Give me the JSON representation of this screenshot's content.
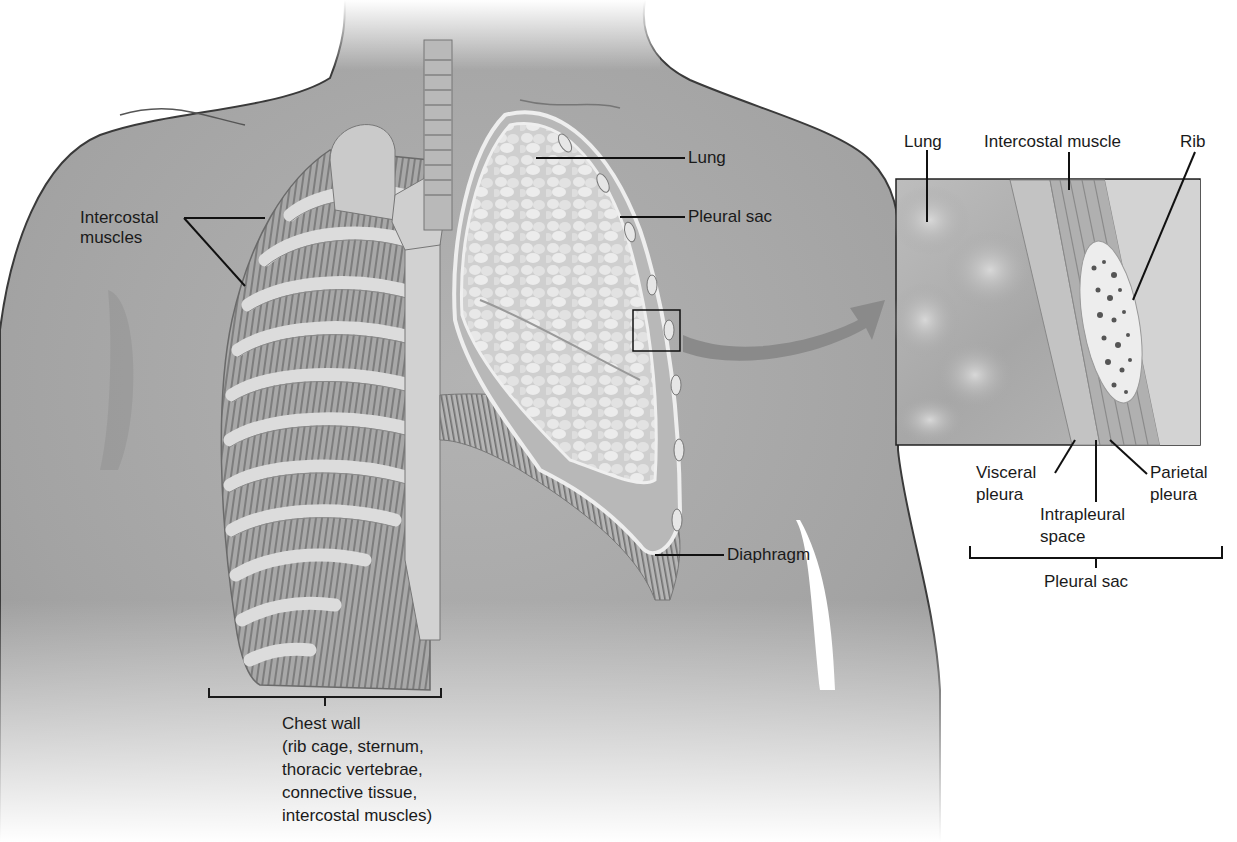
{
  "figure": {
    "colors": {
      "background": "#ffffff",
      "skin": "#a9a9a9",
      "skin_shadow": "#8c8c8c",
      "outline": "#3a3a3a",
      "bone": "#d9d9d9",
      "muscle": "#9a9a9a",
      "lung": "#d4d4d4",
      "label_text": "#1a1a1a",
      "leader_line": "#111111",
      "arrow": "#8a8a8a"
    }
  },
  "labels": {
    "intercostal_muscles": "Intercostal\nmuscles",
    "lung": "Lung",
    "pleural_sac": "Pleural sac",
    "diaphragm": "Diaphragm",
    "chest_wall": "Chest wall\n(rib cage, sternum,\nthoracic vertebrae,\nconnective tissue,\nintercostal muscles)"
  },
  "inset": {
    "labels": {
      "lung": "Lung",
      "intercostal_muscle": "Intercostal muscle",
      "rib": "Rib",
      "visceral_pleura": "Visceral\npleura",
      "intrapleural_space": "Intrapleural\nspace",
      "parietal_pleura": "Parietal\npleura",
      "pleural_sac": "Pleural sac"
    }
  }
}
